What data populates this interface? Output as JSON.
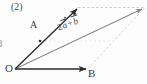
{
  "figure": {
    "item_number": "(2)",
    "left_clipped_glyph": "3",
    "points": {
      "origin": "O",
      "a": "A",
      "b": "B"
    },
    "resultant_label": {
      "coefficient": "2",
      "vector_a": "a",
      "operator": "+",
      "vector_b": "b",
      "full_text": "2a + b"
    },
    "colors": {
      "solid_vector": "#2b2b2b",
      "resultant_line": "#8a8a8a",
      "construction_dashed": "#bdbdbd",
      "background": "#fdfdfd",
      "text": "#3a3a3a"
    },
    "geometry": {
      "origin_xy": [
        15,
        69
      ],
      "point_a_xy": [
        40,
        41
      ],
      "point_b_xy": [
        88,
        69
      ],
      "point_2a_xy": [
        78,
        8
      ],
      "point_resultant_xy": [
        144,
        8
      ]
    }
  }
}
